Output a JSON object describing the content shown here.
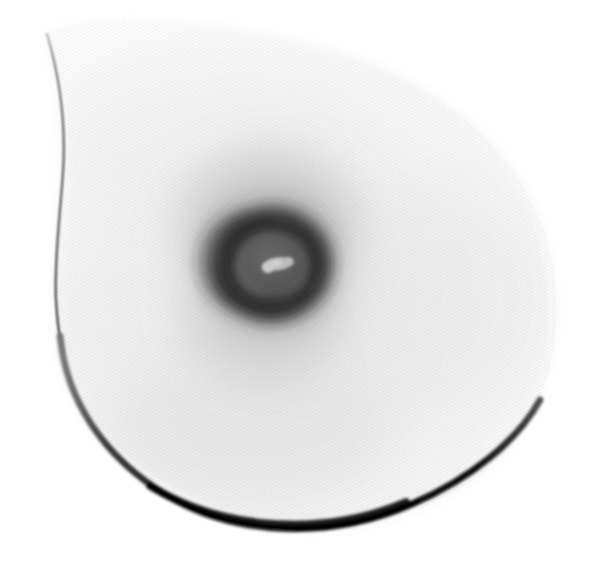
{
  "image": {
    "kind": "medical-scan",
    "modality": "mammogram",
    "title": "Mammographic projection of breast tissue",
    "orientation": "left-lateral teardrop silhouette",
    "polarity": "inverted-grayscale (dense tissue rendered dark)",
    "width_px": 593,
    "height_px": 573,
    "background_color": "#ffffff",
    "texture": {
      "name": "fine-diagonal-weave",
      "angle_deg": 62,
      "pitch_px": 3,
      "opacity": 0.3
    }
  },
  "palette": {
    "background": "#ffffff",
    "tissue_lightest": "#fbfbfb",
    "tissue_light": "#f3f3f3",
    "tissue_mid": "#e2e2e2",
    "halo_outer": "#c8c8c8",
    "halo_mid": "#9a9a9a",
    "areola_ring": "#4a4a4a",
    "areola_ring_dark": "#2e2e2e",
    "areola_inner_disc": "#5e5e5e",
    "nipple_highlight": "#c6c6c6",
    "contour_thin": "#5a5a5a",
    "contour_thick": "#0a0a0a"
  },
  "regions": [
    {
      "id": "tissue-silhouette",
      "label": "Breast tissue silhouette",
      "shape": "teardrop",
      "apex_px": [
        47,
        35
      ],
      "bbox_px": [
        40,
        30,
        560,
        532
      ],
      "fill_from": "#fdfdfd",
      "fill_to": "#e6e6e6"
    },
    {
      "id": "glandular-halo",
      "label": "Glandular density halo",
      "center_px": [
        272,
        262
      ],
      "outer_radius_px": 108,
      "fill_center": "#8f8f8f",
      "fill_edge": "#ffffff"
    },
    {
      "id": "areola-ring",
      "label": "Areolar ring",
      "center_px": [
        272,
        264
      ],
      "outer_radius_px": 58,
      "inner_radius_px": 36,
      "fill": "#3a3a3a"
    },
    {
      "id": "areola-disc",
      "label": "Inner areolar disc",
      "center_px": [
        272,
        264
      ],
      "radius_x_px": 38,
      "radius_y_px": 34,
      "fill": "#5c5c5c"
    },
    {
      "id": "nipple-highlight",
      "label": "Nipple radiolucent highlight",
      "center_px": [
        278,
        265
      ],
      "radius_x_px": 14,
      "radius_y_px": 7,
      "rotation_deg": -6,
      "fill": "#c8c8c8"
    },
    {
      "id": "skin-contour-superior",
      "label": "Superior skin contour line",
      "from_px": [
        47,
        35
      ],
      "to_px": [
        62,
        330
      ],
      "stroke": "#6a6a6a",
      "stroke_width_px": 2.2
    },
    {
      "id": "skin-contour-inferior",
      "label": "Inferior skin contour line",
      "from_px": [
        62,
        330
      ],
      "to_px": [
        540,
        402
      ],
      "stroke": "#0b0b0b",
      "stroke_width_px": 7
    }
  ],
  "annotations": {
    "visible_text": [],
    "visible_markers": [],
    "note": "No on-image text, rulers, labels, scale bars or UI chrome are rendered in this scan."
  },
  "measurements": {
    "areola_center_x_px": 272,
    "areola_center_y_px": 264,
    "areola_outer_diameter_px": 116,
    "halo_outer_diameter_px": 216,
    "nipple_major_axis_px": 28,
    "nipple_minor_axis_px": 14,
    "inferior_contour_max_thickness_px": 8,
    "silhouette_apex_x_px": 47,
    "silhouette_apex_y_px": 35
  }
}
